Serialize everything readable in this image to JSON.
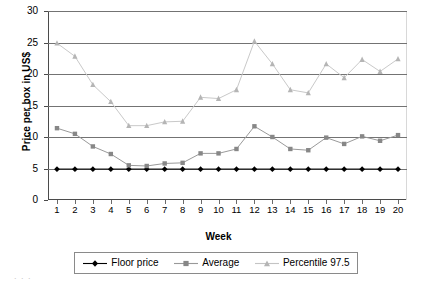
{
  "chart_data": {
    "type": "line",
    "title": "",
    "xlabel": "Week",
    "ylabel": "Price per box in US$",
    "categories": [
      "1",
      "2",
      "3",
      "4",
      "5",
      "6",
      "7",
      "8",
      "9",
      "10",
      "11",
      "12",
      "13",
      "14",
      "15",
      "16",
      "17",
      "18",
      "19",
      "20"
    ],
    "x": [
      1,
      2,
      3,
      4,
      5,
      6,
      7,
      8,
      9,
      10,
      11,
      12,
      13,
      14,
      15,
      16,
      17,
      18,
      19,
      20
    ],
    "xlim": [
      0.5,
      20.5
    ],
    "ylim": [
      0,
      30
    ],
    "ytick_labels": [
      "0",
      "5",
      "10",
      "15",
      "20",
      "25",
      "30"
    ],
    "yticks": [
      0,
      5,
      10,
      15,
      20,
      25,
      30
    ],
    "grid": "horizontal",
    "legend_position": "below",
    "series": [
      {
        "name": "Floor price",
        "color": "#000000",
        "marker": "diamond",
        "values": [
          4.9,
          4.9,
          4.9,
          4.9,
          4.9,
          4.9,
          4.9,
          4.9,
          4.9,
          4.9,
          4.9,
          4.9,
          4.9,
          4.9,
          4.9,
          4.9,
          4.9,
          4.9,
          4.9,
          4.9
        ]
      },
      {
        "name": "Average",
        "color": "#878787",
        "marker": "square",
        "values": [
          11.4,
          10.5,
          8.5,
          7.3,
          5.5,
          5.4,
          5.8,
          5.9,
          7.4,
          7.4,
          8.1,
          11.7,
          10.0,
          8.1,
          7.9,
          9.9,
          8.9,
          10.1,
          9.4,
          10.3
        ]
      },
      {
        "name": "Percentile 97.5",
        "color": "#b5b5b5",
        "marker": "triangle",
        "values": [
          24.9,
          22.8,
          18.3,
          15.6,
          11.8,
          11.8,
          12.4,
          12.5,
          16.3,
          16.1,
          17.5,
          25.2,
          21.6,
          17.5,
          17.0,
          21.6,
          19.4,
          22.3,
          20.4,
          22.4
        ]
      }
    ]
  },
  "legend": {
    "items": [
      {
        "label": "Floor price"
      },
      {
        "label": "Average"
      },
      {
        "label": "Percentile 97.5"
      }
    ]
  },
  "artifact": {
    "text": ". . ."
  }
}
